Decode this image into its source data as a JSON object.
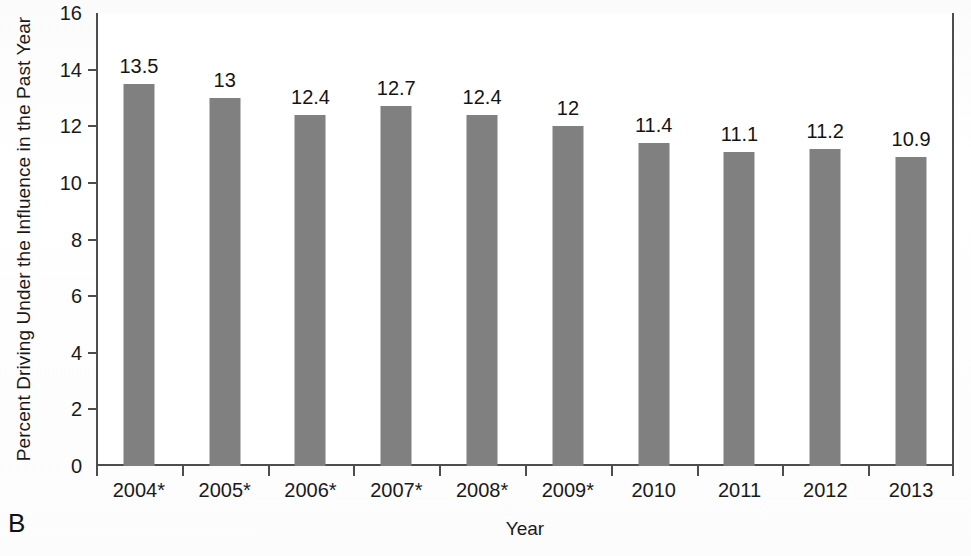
{
  "panel": {
    "label": "B"
  },
  "chart_data": {
    "type": "bar",
    "title": "",
    "subtitle": "",
    "xlabel": "Year",
    "ylabel": "Percent Driving Under the Influence in the Past Year",
    "categories": [
      "2004*",
      "2005*",
      "2006*",
      "2007*",
      "2008*",
      "2009*",
      "2010",
      "2011",
      "2012",
      "2013"
    ],
    "values": [
      13.5,
      13,
      12.4,
      12.7,
      12.4,
      12,
      11.4,
      11.1,
      11.2,
      10.9
    ],
    "value_labels": [
      "13.5",
      "13",
      "12.4",
      "12.7",
      "12.4",
      "12",
      "11.4",
      "11.1",
      "11.2",
      "10.9"
    ],
    "ylim": [
      0,
      16
    ],
    "yticks": [
      0,
      2,
      4,
      6,
      8,
      10,
      12,
      14,
      16
    ],
    "ytick_labels": [
      "0",
      "2",
      "4",
      "6",
      "8",
      "10",
      "12",
      "14",
      "16"
    ],
    "grid": false,
    "legend": "none",
    "series": [
      {
        "name": "Percent Driving Under the Influence in the Past Year",
        "color": "#808080",
        "values": [
          13.5,
          13,
          12.4,
          12.7,
          12.4,
          12,
          11.4,
          11.1,
          11.2,
          10.9
        ]
      }
    ],
    "colors": {
      "bar": "#808080",
      "axis": "#4d4d4d",
      "text": "#1a1a1a",
      "background": "#ffffff"
    }
  }
}
